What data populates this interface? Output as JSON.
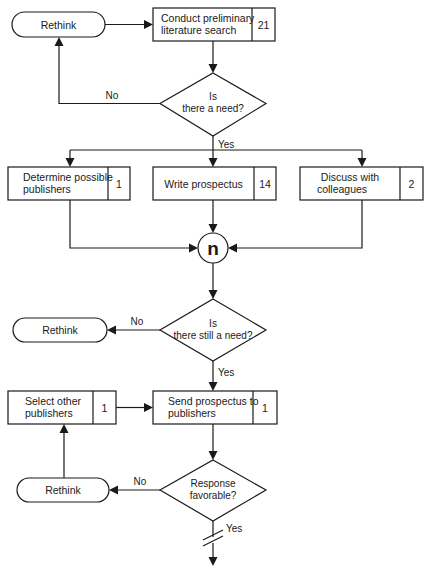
{
  "diagram": {
    "type": "flowchart",
    "colors": {
      "line": "#1a1a1a",
      "background": "#ffffff"
    },
    "terminals": [
      {
        "id": "rethink-1",
        "label": "Rethink"
      },
      {
        "id": "rethink-2",
        "label": "Rethink"
      },
      {
        "id": "rethink-3",
        "label": "Rethink"
      }
    ],
    "processes": [
      {
        "id": "lit-search",
        "line1": "Conduct preliminary",
        "line2": "literature search",
        "count": "21"
      },
      {
        "id": "determine-publishers",
        "line1": "Determine possible",
        "line2": "publishers",
        "count": "1"
      },
      {
        "id": "write-prospectus",
        "line1": "Write prospectus",
        "line2": "",
        "count": "14"
      },
      {
        "id": "discuss-colleagues",
        "line1": "Discuss with",
        "line2": "colleagues",
        "count": "2"
      },
      {
        "id": "send-prospectus",
        "line1": "Send prospectus to",
        "line2": "publishers",
        "count": "1"
      },
      {
        "id": "select-other",
        "line1": "Select other",
        "line2": "publishers",
        "count": "1"
      }
    ],
    "decisions": [
      {
        "id": "need",
        "line1": "Is",
        "line2": "there a need?",
        "yes": "Yes",
        "no": "No"
      },
      {
        "id": "still-need",
        "line1": "Is",
        "line2": "there still a need?",
        "yes": "Yes",
        "no": "No"
      },
      {
        "id": "response",
        "line1": "Response",
        "line2": "favorable?",
        "yes": "Yes",
        "no": "No"
      }
    ],
    "connector": {
      "label": "n"
    }
  }
}
